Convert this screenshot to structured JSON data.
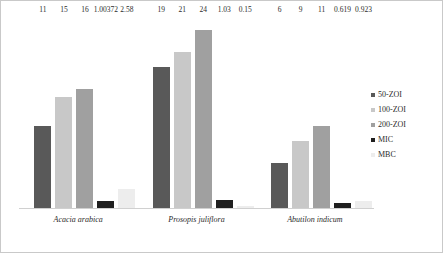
{
  "chart_data": {
    "type": "bar",
    "title": "",
    "subtitle": "",
    "xlabel": "",
    "ylabel": "",
    "ylim": [
      0,
      26
    ],
    "grid": false,
    "legend_position": "right",
    "categories": [
      "Acacia arabica",
      "Prosopis juliflora",
      "Abutilon indicum"
    ],
    "series": [
      {
        "name": "50-ZOI",
        "color": "#595959",
        "values": [
          11,
          19,
          6
        ],
        "labels": [
          "11",
          "19",
          "6"
        ]
      },
      {
        "name": "100-ZOI",
        "color": "#c8c8c8",
        "values": [
          15,
          21,
          9
        ],
        "labels": [
          "15",
          "21",
          "9"
        ]
      },
      {
        "name": "200-ZOI",
        "color": "#a0a0a0",
        "values": [
          16,
          24,
          11
        ],
        "labels": [
          "16",
          "24",
          "11"
        ]
      },
      {
        "name": "MIC",
        "color": "#1f1f1f",
        "values": [
          1.00372,
          1.03,
          0.619
        ],
        "labels": [
          "1.00372",
          "1.03",
          "0.619"
        ]
      },
      {
        "name": "MBC",
        "color": "#ededed",
        "values": [
          2.58,
          0.15,
          0.923
        ],
        "labels": [
          "2.58",
          "0.15",
          "0.923"
        ]
      }
    ]
  },
  "legend": {
    "items": [
      {
        "label": "50-ZOI"
      },
      {
        "label": "100-ZOI"
      },
      {
        "label": "200-ZOI"
      },
      {
        "label": "MIC"
      },
      {
        "label": "MBC"
      }
    ]
  }
}
